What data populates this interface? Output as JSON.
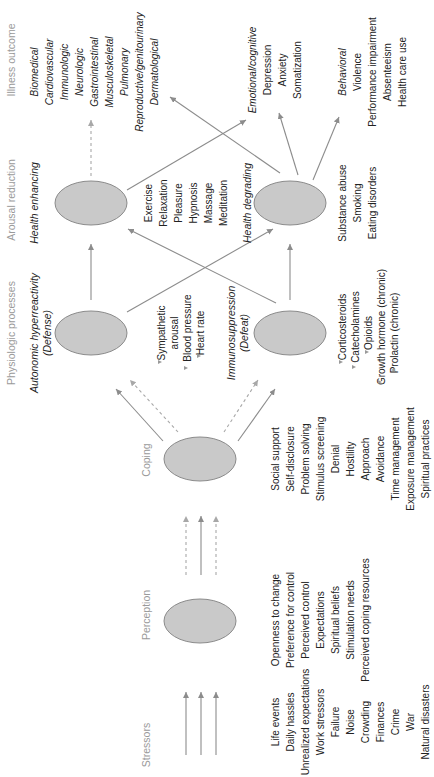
{
  "orientation": "rotated-90-ccw",
  "columns": {
    "stressors": {
      "header": "Stressors",
      "items": [
        "Life events",
        "Daily hassles",
        "Unrealized expectations",
        "Work stressors",
        "Failure",
        "Noise",
        "Crowding",
        "Finances",
        "Crime",
        "War",
        "Natural disasters"
      ]
    },
    "perception": {
      "header": "Perception",
      "items": [
        "Openness to change",
        "Preference for control",
        "Perceived control",
        "Expectations",
        "Spiritual beliefs",
        "Stimulation needs",
        "Perceived coping resources"
      ]
    },
    "coping": {
      "header": "Coping",
      "items": [
        "Social support",
        "Self-disclosure",
        "Problem solving",
        "Stimulus screening",
        "Denial",
        "Hostility",
        "Approach",
        "Avoidance",
        "Time management",
        "Exposure management",
        "Spiritual practices"
      ]
    },
    "physiologic": {
      "header": "Physiologic processes",
      "defense": {
        "title": "Autonomic hyperreactivity",
        "subtitle": "(Defense)",
        "items": [
          {
            "dir": "up",
            "label": "Sympathetic"
          },
          {
            "dir": "",
            "label": "arousal"
          },
          {
            "dir": "up",
            "label": "Blood pressure"
          },
          {
            "dir": "up",
            "label": "Heart rate"
          }
        ]
      },
      "defeat": {
        "title": "Immunosuppression",
        "subtitle": "(Defeat)",
        "items": [
          {
            "dir": "up",
            "label": "Corticosteroids"
          },
          {
            "dir": "up",
            "label": "Catecholamines"
          },
          {
            "dir": "up",
            "label": "Opioids"
          },
          {
            "dir": "up",
            "label": "Growth hormone (chronic)"
          },
          {
            "dir": "down",
            "label": "Prolactin (chronic)"
          }
        ]
      }
    },
    "arousal": {
      "header": "Arousal reduction",
      "enhancing": {
        "title": "Health enhancing",
        "items": [
          "Exercise",
          "Relaxation",
          "Pleasure",
          "Hypnosis",
          "Massage",
          "Meditation"
        ]
      },
      "degrading": {
        "title": "Health degrading",
        "items": [
          "Substance abuse",
          "Smoking",
          "Eating disorders"
        ]
      }
    },
    "illness": {
      "header": "Illness outcome",
      "biomedical": {
        "title": "Biomedical",
        "items": [
          "Cardiovascular",
          "Immunologic",
          "Neurologic",
          "Gastrointestinal",
          "Musculoskeletal",
          "Pulmonary",
          "Reproductive/genitourinary",
          "Dermatological"
        ]
      },
      "emotional": {
        "title": "Emotional/cognitive",
        "items": [
          "Depression",
          "Anxiety",
          "Somatization"
        ]
      },
      "behavioral": {
        "title": "Behavioral",
        "items": [
          "Violence",
          "Performance impairment",
          "Absenteeism",
          "Health care use"
        ]
      }
    }
  },
  "colors": {
    "ellipse_fill": "#c9c9c9",
    "ellipse_stroke": "#8a8a8a",
    "arrow": "#8c8c8c",
    "header_text": "#9a9a9a",
    "body_text": "#222222"
  }
}
